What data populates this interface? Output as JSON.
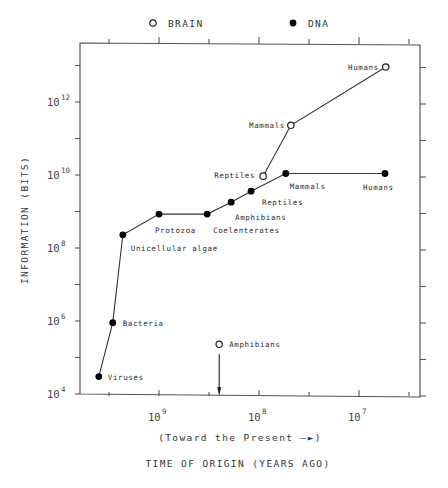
{
  "chart_data": {
    "type": "line",
    "title": "",
    "xlabel": "TIME OF ORIGIN (YEARS AGO)",
    "xsublabel": "(Toward the Present —►)",
    "ylabel": "INFORMATION (BITS)",
    "xscale": "log",
    "yscale": "log",
    "x_reversed": true,
    "xlim": [
      6200000000.0,
      2500000.0
    ],
    "ylim": [
      10000.0,
      40000000000000.0
    ],
    "x_ticks": [
      {
        "value": 1000000000.0,
        "base": "10",
        "exp": "9"
      },
      {
        "value": 100000000.0,
        "base": "10",
        "exp": "8"
      },
      {
        "value": 10000000.0,
        "base": "10",
        "exp": "7"
      }
    ],
    "y_ticks": [
      {
        "value": 10000.0,
        "base": "10",
        "exp": "4"
      },
      {
        "value": 1000000.0,
        "base": "10",
        "exp": "6"
      },
      {
        "value": 100000000.0,
        "base": "10",
        "exp": "8"
      },
      {
        "value": 10000000000.0,
        "base": "10",
        "exp": "10"
      },
      {
        "value": 1000000000000.0,
        "base": "10",
        "exp": "12"
      }
    ],
    "grid": false,
    "legend": {
      "placement": "top",
      "entries": [
        {
          "name": "BRAIN",
          "marker": "open-circle"
        },
        {
          "name": "DNA",
          "marker": "filled-circle"
        }
      ]
    },
    "series": [
      {
        "name": "DNA",
        "marker": "filled-circle",
        "points": [
          {
            "label": "Viruses",
            "x": 4000000000.0,
            "y": 30000.0
          },
          {
            "label": "Bacteria",
            "x": 2900000000.0,
            "y": 900000.0
          },
          {
            "label": "Unicellular algae",
            "x": 2300000000.0,
            "y": 230000000.0
          },
          {
            "label": "Protozoa",
            "x": 1000000000.0,
            "y": 850000000.0
          },
          {
            "label": "Coelenterates",
            "x": 330000000.0,
            "y": 850000000.0
          },
          {
            "label": "Amphibians",
            "x": 190000000.0,
            "y": 1800000000.0
          },
          {
            "label": "Reptiles",
            "x": 120000000.0,
            "y": 3600000000.0
          },
          {
            "label": "Mammals",
            "x": 54000000.0,
            "y": 11000000000.0
          },
          {
            "label": "Humans",
            "x": 5500000.0,
            "y": 11000000000.0
          }
        ]
      },
      {
        "name": "BRAIN",
        "marker": "open-circle",
        "connected_from_index": 1,
        "points": [
          {
            "label": "Amphibians",
            "x": 250000000.0,
            "y": 230000.0,
            "annotation": "arrow-down"
          },
          {
            "label": "Reptiles",
            "x": 91000000.0,
            "y": 9300000000.0
          },
          {
            "label": "Mammals",
            "x": 48000000.0,
            "y": 230000000000.0
          },
          {
            "label": "Humans",
            "x": 5400000.0,
            "y": 9100000000000.0
          }
        ]
      }
    ]
  }
}
